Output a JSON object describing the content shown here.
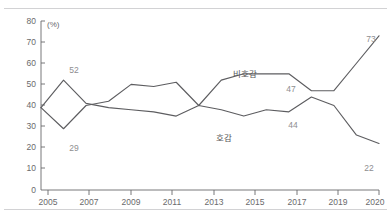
{
  "chart_data": {
    "type": "line",
    "title": "",
    "xlabel": "",
    "ylabel": "",
    "unit_label": "(%)",
    "ylim": [
      0,
      80
    ],
    "yticks": [
      0,
      10,
      20,
      30,
      40,
      50,
      60,
      70,
      80
    ],
    "xticks": [
      "2005",
      "2007",
      "2009",
      "2011",
      "2013",
      "2015",
      "2017",
      "2019",
      "2020"
    ],
    "x": [
      2005,
      2006,
      2007,
      2008,
      2009,
      2010,
      2011,
      2012,
      2013,
      2014,
      2015,
      2016,
      2017,
      2018,
      2019,
      2020
    ],
    "grid": false,
    "legend": "inline-annotations",
    "series": [
      {
        "name": "호감",
        "label": "호감",
        "values": [
          39,
          52,
          41,
          39,
          38,
          37,
          35,
          40,
          38,
          35,
          38,
          37,
          44,
          40,
          26,
          22
        ]
      },
      {
        "name": "비호감",
        "label": "비호감",
        "values": [
          39,
          29,
          40,
          42,
          50,
          49,
          51,
          40,
          52,
          55,
          55,
          55,
          47,
          47,
          60,
          73
        ]
      }
    ],
    "annotations": [
      {
        "text": "52",
        "series": "호감",
        "year": 2006
      },
      {
        "text": "29",
        "series": "비호감",
        "year": 2006
      },
      {
        "text": "47",
        "series": "비호감",
        "year": 2017
      },
      {
        "text": "44",
        "series": "호감",
        "year": 2017
      },
      {
        "text": "73",
        "series": "비호감",
        "year": 2020
      },
      {
        "text": "22",
        "series": "호감",
        "year": 2020
      }
    ],
    "series_labels": [
      {
        "text": "비호감",
        "year": 2014
      },
      {
        "text": "호감",
        "year": 2014
      }
    ]
  },
  "axis": {
    "unit": "(%)",
    "y": {
      "t0": "0",
      "t1": "10",
      "t2": "20",
      "t3": "30",
      "t4": "40",
      "t5": "50",
      "t6": "60",
      "t7": "70",
      "t8": "80"
    },
    "x": {
      "t0": "2005",
      "t1": "2007",
      "t2": "2009",
      "t3": "2011",
      "t4": "2013",
      "t5": "2015",
      "t6": "2017",
      "t7": "2019",
      "t8": "2020"
    }
  },
  "labels": {
    "v52": "52",
    "v29": "29",
    "v47": "47",
    "v44": "44",
    "v73": "73",
    "v22": "22",
    "bihogam": "비호감",
    "hogam": "호감"
  }
}
